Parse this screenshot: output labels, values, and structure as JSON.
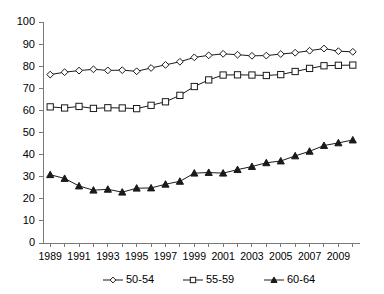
{
  "chart_data": {
    "type": "line",
    "title": "",
    "subtitle": "",
    "xlabel": "",
    "ylabel": "",
    "grid": false,
    "legend_position": "bottom",
    "ylim": [
      0,
      100
    ],
    "ytick_step": 10,
    "yticks": [
      "0",
      "10",
      "20",
      "30",
      "40",
      "50",
      "60",
      "70",
      "80",
      "90",
      "100"
    ],
    "x": [
      1989,
      1990,
      1991,
      1992,
      1993,
      1994,
      1995,
      1996,
      1997,
      1998,
      1999,
      2000,
      2001,
      2002,
      2003,
      2004,
      2005,
      2006,
      2007,
      2008,
      2009,
      2010
    ],
    "xtick_labels": [
      "1989",
      "",
      "1991",
      "",
      "1993",
      "",
      "1995",
      "",
      "1997",
      "",
      "1999",
      "",
      "2001",
      "",
      "2003",
      "",
      "2005",
      "",
      "2007",
      "",
      "2009",
      ""
    ],
    "xtick_labels_shown": [
      "1989",
      "1991",
      "1993",
      "1995",
      "1997",
      "1999",
      "2001",
      "2003",
      "2005",
      "2007",
      "2009"
    ],
    "series": [
      {
        "name": "50-54",
        "marker": "diamond-open",
        "color": "#1a1a1a",
        "values": [
          76.2,
          77.3,
          78.0,
          78.6,
          78.1,
          78.2,
          77.7,
          79.2,
          80.6,
          82.0,
          84.0,
          84.9,
          85.6,
          85.2,
          84.7,
          84.8,
          85.5,
          86.1,
          87.0,
          88.0,
          86.8,
          86.5
        ]
      },
      {
        "name": "55-59",
        "marker": "square-open",
        "color": "#1a1a1a",
        "values": [
          61.6,
          61.1,
          61.8,
          60.9,
          61.2,
          61.1,
          60.8,
          62.3,
          63.9,
          66.8,
          70.8,
          73.8,
          76.0,
          76.1,
          76.0,
          75.8,
          76.2,
          77.6,
          79.0,
          80.2,
          80.4,
          80.5
        ]
      },
      {
        "name": "60-64",
        "marker": "triangle-solid",
        "color": "#1a1a1a",
        "values": [
          30.9,
          29.2,
          25.8,
          23.9,
          24.3,
          23.0,
          24.8,
          24.9,
          26.6,
          27.9,
          31.6,
          31.9,
          31.6,
          33.2,
          34.6,
          36.3,
          37.1,
          39.4,
          41.5,
          44.1,
          45.3,
          46.6
        ]
      }
    ],
    "legend": [
      {
        "label": "50-54",
        "marker": "diamond-open"
      },
      {
        "label": "55-59",
        "marker": "square-open"
      },
      {
        "label": "60-64",
        "marker": "triangle-solid"
      }
    ]
  }
}
